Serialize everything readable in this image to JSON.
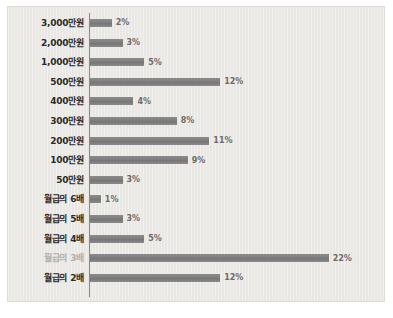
{
  "chart_data": {
    "type": "bar",
    "orientation": "horizontal",
    "title": "",
    "subtitle": "",
    "xlabel": "",
    "ylabel": "",
    "xlim": [
      0,
      26
    ],
    "grid": false,
    "legend": null,
    "value_suffix": "%",
    "categories": [
      "3,000만원",
      "2,000만원",
      "1,000만원",
      "500만원",
      "400만원",
      "300만원",
      "200만원",
      "100만원",
      "50만원",
      "월급의 6배",
      "월급의 5배",
      "월급의 4배",
      "월급의 3배",
      "월급의 2배"
    ],
    "values": [
      2,
      3,
      5,
      12,
      4,
      8,
      11,
      9,
      3,
      1,
      3,
      5,
      22,
      12
    ],
    "value_labels": [
      "2%",
      "3%",
      "5%",
      "12%",
      "4%",
      "8%",
      "11%",
      "9%",
      "3%",
      "1%",
      "3%",
      "5%",
      "22%",
      "12%"
    ],
    "muted_categories": [
      "월급의 3배"
    ]
  },
  "colors": {
    "panel_background": "#eceae6",
    "panel_border": "#dedbd5",
    "bar_fill": "#838383",
    "axis_line": "#8d8a85",
    "category_text": "#2b2b2b",
    "category_text_muted": "#b3b0ab",
    "value_text": "#6e6b66",
    "page_background": "#ffffff"
  }
}
